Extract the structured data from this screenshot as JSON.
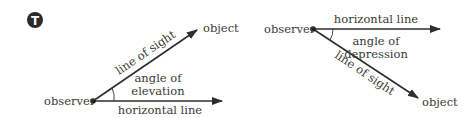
{
  "badge": {
    "letter": "T",
    "color": "#2b2b2b"
  },
  "colors": {
    "line": "#2e2e2e",
    "text": "#3a3a3a"
  },
  "elevation": {
    "observer_label": "observer",
    "object_label": "object",
    "line_of_sight_label": "line of sight",
    "angle_label_line1": "angle of",
    "angle_label_line2": "elevation",
    "horizontal_label": "horizontal line"
  },
  "depression": {
    "observer_label": "observer",
    "object_label": "object",
    "line_of_sight_label": "line of sight",
    "angle_label_line1": "angle of",
    "angle_label_line2": "depression",
    "horizontal_label": "horizontal line"
  }
}
